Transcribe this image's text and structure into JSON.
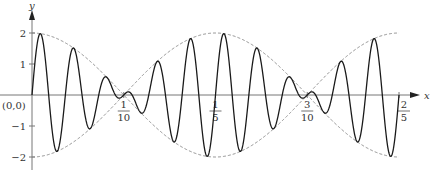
{
  "chart_data": {
    "type": "line",
    "title": "",
    "xlabel": "x",
    "ylabel": "y",
    "origin_label": "(0,0)",
    "xlim": [
      0,
      0.4
    ],
    "ylim": [
      -2,
      2
    ],
    "grid": false,
    "legend": null,
    "x_ticks": [
      {
        "value": 0.1,
        "num": "1",
        "den": "10"
      },
      {
        "value": 0.2,
        "num": "1",
        "den": "5"
      },
      {
        "value": 0.3,
        "num": "3",
        "den": "10"
      },
      {
        "value": 0.4,
        "num": "2",
        "den": "5"
      }
    ],
    "y_ticks": [
      {
        "value": 2,
        "label": "2"
      },
      {
        "value": 1,
        "label": "1"
      },
      {
        "value": -1,
        "label": "−1"
      },
      {
        "value": -2,
        "label": "−2"
      }
    ],
    "series": [
      {
        "name": "signal",
        "style": "solid",
        "color": "#1a1a1a",
        "expression": "2cos(5πx)·sin(55πx)"
      },
      {
        "name": "upper envelope",
        "style": "dashed",
        "color": "#888888",
        "expression": "2cos(5πx)"
      },
      {
        "name": "lower envelope",
        "style": "dashed",
        "color": "#888888",
        "expression": "-2cos(5πx)"
      }
    ]
  }
}
